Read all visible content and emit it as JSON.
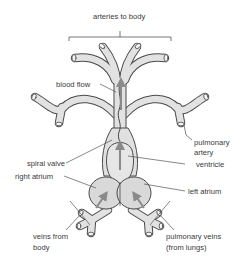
{
  "diagram": {
    "type": "anatomy",
    "labels": {
      "arteries_to_body": "arteries to body",
      "blood_flow": "blood flow",
      "spiral_valve": "spiral valve",
      "pulmonary_artery_1": "pulmonary",
      "pulmonary_artery_2": "artery",
      "right_atrium": "right atrium",
      "ventricle": "ventricle",
      "left_atrium": "left atrium",
      "veins_from_body_1": "veins from",
      "veins_from_body_2": "body",
      "pulmonary_veins_1": "pulmonary veins",
      "pulmonary_veins_2": "(from lungs)"
    },
    "colors": {
      "vessel_fill": "#e2e2e2",
      "vessel_stroke": "#4a4a4a",
      "arrow": "#8a8a8a",
      "leader_line": "#555555",
      "text": "#3a3a3a"
    }
  }
}
